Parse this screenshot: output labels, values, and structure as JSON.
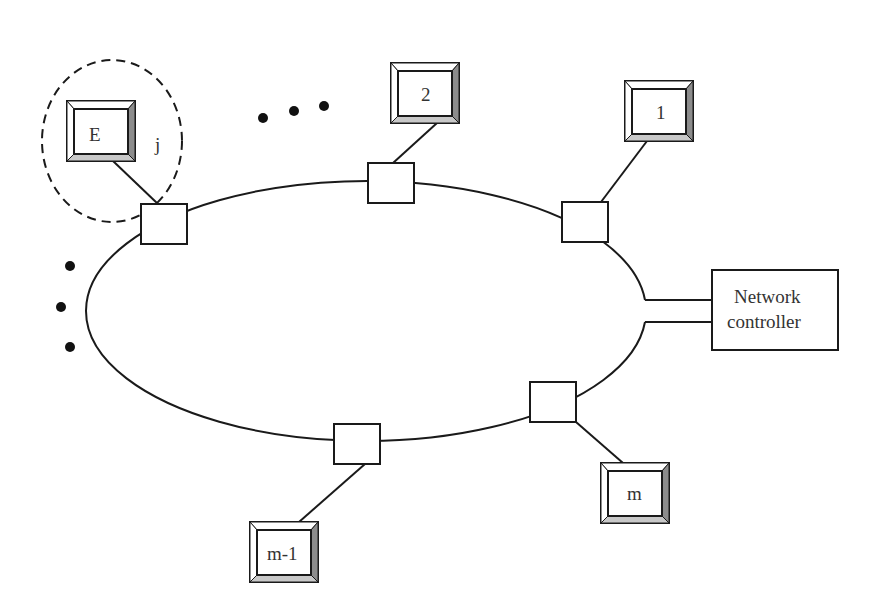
{
  "diagram": {
    "type": "ring-network",
    "ring": {
      "cx": 368,
      "cy": 310,
      "rx": 280,
      "ry": 130
    },
    "terminals": [
      {
        "id": "E",
        "label": "E",
        "x": 67,
        "y": 101,
        "w": 68,
        "h": 60,
        "iface": {
          "x": 141,
          "y": 204,
          "w": 46,
          "h": 40
        }
      },
      {
        "id": "2",
        "label": "2",
        "x": 391,
        "y": 63,
        "w": 68,
        "h": 60,
        "iface": {
          "x": 368,
          "y": 163,
          "w": 46,
          "h": 40
        }
      },
      {
        "id": "1",
        "label": "1",
        "x": 625,
        "y": 81,
        "w": 68,
        "h": 60,
        "iface": {
          "x": 562,
          "y": 202,
          "w": 46,
          "h": 40
        }
      },
      {
        "id": "m",
        "label": "m",
        "x": 601,
        "y": 463,
        "w": 68,
        "h": 60,
        "iface": {
          "x": 530,
          "y": 382,
          "w": 46,
          "h": 40
        }
      },
      {
        "id": "m-1",
        "label": "m-1",
        "x": 250,
        "y": 522,
        "w": 68,
        "h": 60,
        "iface": {
          "x": 334,
          "y": 424,
          "w": 46,
          "h": 40
        }
      }
    ],
    "group": {
      "label": "j",
      "cx": 112,
      "cy": 141,
      "rx": 70,
      "ry": 81,
      "label_x": 157,
      "label_y": 150
    },
    "controller": {
      "line1": "Network",
      "line2": "controller",
      "x": 712,
      "y": 270,
      "w": 126,
      "h": 80
    },
    "ellipsis_top": [
      {
        "x": 263,
        "y": 118
      },
      {
        "x": 294,
        "y": 111
      },
      {
        "x": 324,
        "y": 106
      }
    ],
    "ellipsis_left": [
      {
        "x": 70,
        "y": 266
      },
      {
        "x": 61,
        "y": 307
      },
      {
        "x": 70,
        "y": 347
      }
    ]
  }
}
